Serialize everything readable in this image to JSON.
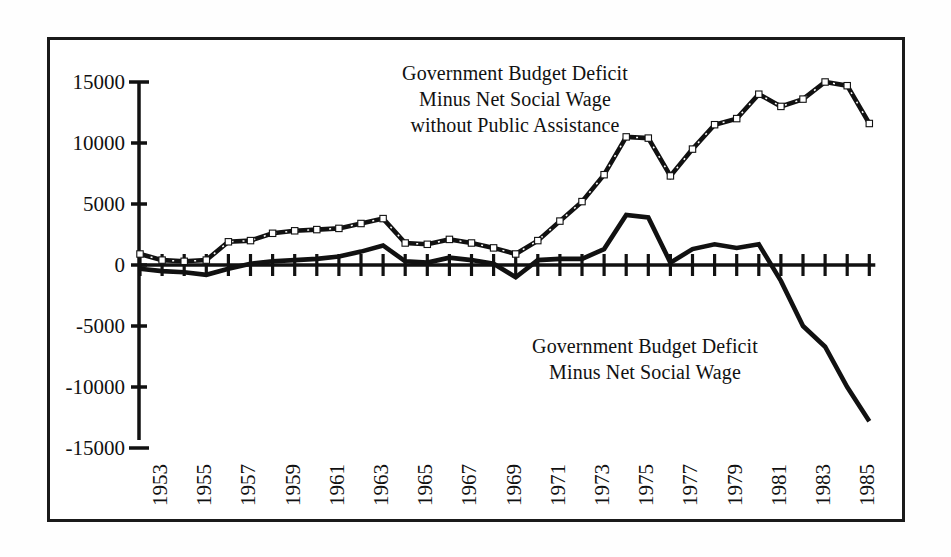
{
  "figure": {
    "background_color": "#ffffff",
    "frame_color": "#1a1a1a"
  },
  "annotations": {
    "upper": {
      "line1": "Government Budget Deficit",
      "line2": "Minus Net Social Wage",
      "line3": "without Public Assistance"
    },
    "lower": {
      "line1": "Government Budget Deficit",
      "line2": "Minus Net Social Wage"
    }
  },
  "chart_data": {
    "type": "line",
    "title": "",
    "xlabel": "",
    "ylabel": "",
    "xlim": [
      1953,
      1986
    ],
    "ylim": [
      -15000,
      15000
    ],
    "grid": false,
    "legend": "annotated-inline",
    "y_ticks": [
      15000,
      10000,
      5000,
      0,
      -5000,
      -10000,
      -15000
    ],
    "y_tick_labels": [
      "15000",
      "10000",
      "5000",
      "0",
      "-5000",
      "-10000",
      "-15000"
    ],
    "x_ticks": [
      1953,
      1955,
      1957,
      1959,
      1961,
      1963,
      1965,
      1967,
      1969,
      1971,
      1973,
      1975,
      1977,
      1979,
      1981,
      1983,
      1985
    ],
    "x_tick_labels": [
      "1953",
      "1955",
      "1957",
      "1959",
      "1961",
      "1963",
      "1965",
      "1967",
      "1969",
      "1971",
      "1973",
      "1975",
      "1977",
      "1979",
      "1981",
      "1983",
      "1985"
    ],
    "x": [
      1953,
      1954,
      1955,
      1956,
      1957,
      1958,
      1959,
      1960,
      1961,
      1962,
      1963,
      1964,
      1965,
      1966,
      1967,
      1968,
      1969,
      1970,
      1971,
      1972,
      1973,
      1974,
      1975,
      1976,
      1977,
      1978,
      1979,
      1980,
      1981,
      1982,
      1983,
      1984,
      1985,
      1986
    ],
    "series": [
      {
        "name": "Government Budget Deficit Minus Net Social Wage without Public Assistance",
        "style": "dashed-with-markers",
        "color": "#111111",
        "values": [
          900,
          400,
          300,
          400,
          1900,
          2000,
          2600,
          2800,
          2900,
          3000,
          3400,
          3800,
          1800,
          1700,
          2100,
          1800,
          1400,
          900,
          2000,
          3600,
          5200,
          7400,
          10500,
          10400,
          7300,
          9500,
          11500,
          12000,
          14000,
          13000,
          13600,
          15000,
          14700,
          11600
        ]
      },
      {
        "name": "Government Budget Deficit Minus Net Social Wage",
        "style": "solid",
        "color": "#111111",
        "values": [
          -300,
          -500,
          -600,
          -800,
          -300,
          100,
          300,
          400,
          500,
          700,
          1100,
          1600,
          300,
          200,
          600,
          400,
          100,
          -1000,
          400,
          500,
          500,
          1300,
          4100,
          3900,
          200,
          1300,
          1700,
          1400,
          1700,
          -1300,
          -5000,
          -6700,
          -10000,
          -12800
        ]
      }
    ]
  }
}
